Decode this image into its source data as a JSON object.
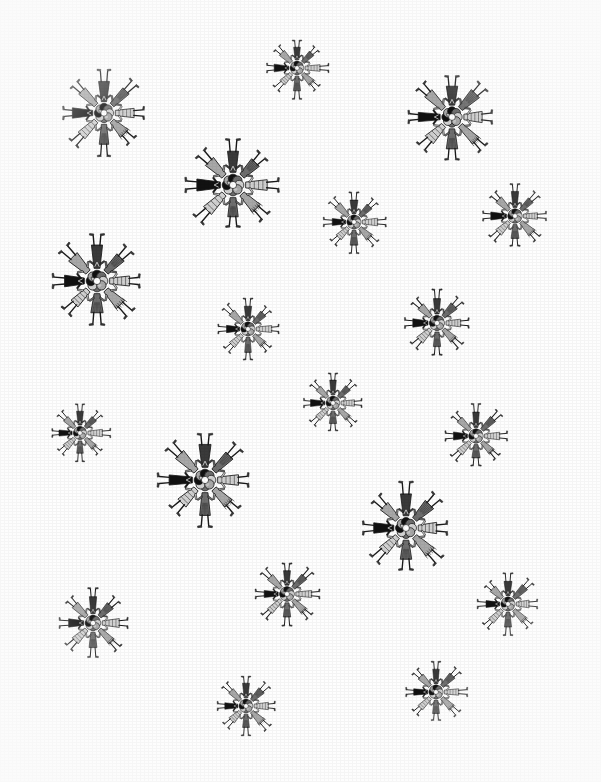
{
  "page": {
    "background_color": "#ffffff",
    "width": 601,
    "height": 782,
    "medium": "grayscale ink and wash illustration"
  },
  "motif": {
    "name": "radial-figure-rosette",
    "figure_count": 8,
    "description": "Eight stylized human figures arranged head-inward around a common center, feet radiating outward",
    "palette": {
      "ink_black": "#111111",
      "dark_gray": "#3a3a3a",
      "mid_gray": "#6e6e6e",
      "light_gray": "#a8a8a8",
      "pale_gray": "#d2d2d2",
      "paper_white": "#ffffff",
      "outline": "#1a1a1a"
    },
    "spokes": [
      {
        "index": 0,
        "angle_deg": 270,
        "label": "north-figure",
        "tone": "mid_gray",
        "garment": "long-robe",
        "headdress": "twin-prong"
      },
      {
        "index": 1,
        "angle_deg": 315,
        "label": "northeast-figure",
        "tone": "pale_gray",
        "garment": "striped-cape",
        "headdress": "single-horn"
      },
      {
        "index": 2,
        "angle_deg": 0,
        "label": "east-figure",
        "tone": "ink_black",
        "garment": "dark-tunic",
        "headdress": "plain"
      },
      {
        "index": 3,
        "angle_deg": 45,
        "label": "southeast-figure",
        "tone": "light_gray",
        "garment": "short-tunic",
        "headdress": "plain"
      },
      {
        "index": 4,
        "angle_deg": 90,
        "label": "south-figure",
        "tone": "dark_gray",
        "garment": "vest-and-skirt",
        "headdress": "round-head"
      },
      {
        "index": 5,
        "angle_deg": 135,
        "label": "southwest-figure",
        "tone": "mid_gray",
        "garment": "long-robe",
        "headdress": "plain"
      },
      {
        "index": 6,
        "angle_deg": 180,
        "label": "west-figure",
        "tone": "pale_gray",
        "garment": "patterned-robe",
        "headdress": "crest"
      },
      {
        "index": 7,
        "angle_deg": 225,
        "label": "northwest-figure",
        "tone": "light_gray",
        "garment": "fringed-cape",
        "headdress": "feather"
      }
    ]
  },
  "instances": [
    {
      "id": "motif-01",
      "cx": 104,
      "cy": 113,
      "scale": 1.0,
      "rotation": 0,
      "size_class": "medium"
    },
    {
      "id": "motif-02",
      "cx": 297,
      "cy": 68,
      "scale": 0.72,
      "rotation": 0,
      "size_class": "small"
    },
    {
      "id": "motif-03",
      "cx": 452,
      "cy": 117,
      "scale": 1.05,
      "rotation": 0,
      "size_class": "medium"
    },
    {
      "id": "motif-04",
      "cx": 233,
      "cy": 185,
      "scale": 1.12,
      "rotation": 0,
      "size_class": "large"
    },
    {
      "id": "motif-05",
      "cx": 354,
      "cy": 222,
      "scale": 0.74,
      "rotation": 0,
      "size_class": "small"
    },
    {
      "id": "motif-06",
      "cx": 515,
      "cy": 216,
      "scale": 0.76,
      "rotation": 0,
      "size_class": "small"
    },
    {
      "id": "motif-07",
      "cx": 97,
      "cy": 281,
      "scale": 1.12,
      "rotation": 0,
      "size_class": "large"
    },
    {
      "id": "motif-08",
      "cx": 248,
      "cy": 329,
      "scale": 0.74,
      "rotation": 0,
      "size_class": "small"
    },
    {
      "id": "motif-09",
      "cx": 437,
      "cy": 323,
      "scale": 0.8,
      "rotation": 0,
      "size_class": "small"
    },
    {
      "id": "motif-10",
      "cx": 333,
      "cy": 403,
      "scale": 0.72,
      "rotation": 0,
      "size_class": "small"
    },
    {
      "id": "motif-11",
      "cx": 80,
      "cy": 433,
      "scale": 0.7,
      "rotation": 0,
      "size_class": "small"
    },
    {
      "id": "motif-12",
      "cx": 476,
      "cy": 436,
      "scale": 0.76,
      "rotation": 0,
      "size_class": "small"
    },
    {
      "id": "motif-13",
      "cx": 205,
      "cy": 480,
      "scale": 1.12,
      "rotation": 0,
      "size_class": "large"
    },
    {
      "id": "motif-14",
      "cx": 406,
      "cy": 528,
      "scale": 1.08,
      "rotation": 0,
      "size_class": "large"
    },
    {
      "id": "motif-15",
      "cx": 93,
      "cy": 623,
      "scale": 0.82,
      "rotation": 0,
      "size_class": "small"
    },
    {
      "id": "motif-16",
      "cx": 287,
      "cy": 594,
      "scale": 0.78,
      "rotation": 0,
      "size_class": "small"
    },
    {
      "id": "motif-17",
      "cx": 508,
      "cy": 604,
      "scale": 0.74,
      "rotation": 0,
      "size_class": "small"
    },
    {
      "id": "motif-18",
      "cx": 246,
      "cy": 706,
      "scale": 0.72,
      "rotation": 0,
      "size_class": "small"
    },
    {
      "id": "motif-19",
      "cx": 436,
      "cy": 692,
      "scale": 0.74,
      "rotation": 0,
      "size_class": "small"
    }
  ]
}
